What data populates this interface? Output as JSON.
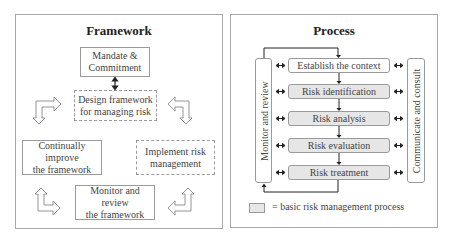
{
  "framework": {
    "title": "Framework",
    "boxes": {
      "mandate": [
        "Mandate &",
        "Commitment"
      ],
      "design": [
        "Design framework",
        "for managing risk"
      ],
      "improve": [
        "Continually improve",
        "the framework"
      ],
      "implement": [
        "Implement risk",
        "management"
      ],
      "monitor": [
        "Monitor and review",
        "the framework"
      ]
    },
    "arrows": [
      "bent-arrow-right-down",
      "bent-arrow-left-down",
      "bent-arrow-up-right",
      "bent-arrow-up-left"
    ]
  },
  "process": {
    "title": "Process",
    "side_left": "Monitor and review",
    "side_right": "Communicate and consult",
    "steps": [
      {
        "label": "Establish the context",
        "basic": false
      },
      {
        "label": "Risk identification",
        "basic": true
      },
      {
        "label": "Risk analysis",
        "basic": true
      },
      {
        "label": "Risk evaluation",
        "basic": true
      },
      {
        "label": "Risk treatment",
        "basic": true
      }
    ],
    "legend": "= basic risk management process",
    "colors": {
      "basic_fill": "#e6e6e6",
      "border": "#9a9a9a"
    }
  }
}
